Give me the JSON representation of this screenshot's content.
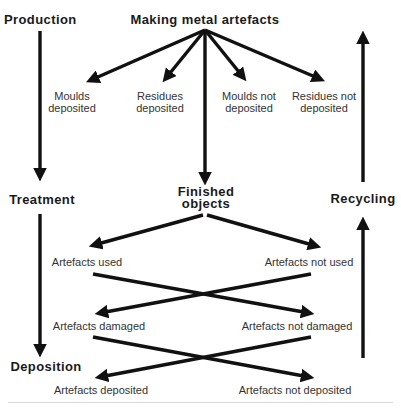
{
  "diagram": {
    "nodes": {
      "production": "Production",
      "making": "Making metal artefacts",
      "moulds_dep_1": "Moulds",
      "moulds_dep_2": "deposited",
      "residues_dep_1": "Residues",
      "residues_dep_2": "deposited",
      "moulds_not_1": "Moulds not",
      "moulds_not_2": "deposited",
      "residues_not_1": "Residues not",
      "residues_not_2": "deposited",
      "treatment": "Treatment",
      "finished_1": "Finished",
      "finished_2": "objects",
      "recycling": "Recycling",
      "used": "Artefacts used",
      "not_used": "Artefacts not used",
      "damaged": "Artefacts damaged",
      "not_damaged": "Artefacts not damaged",
      "deposition": "Deposition",
      "deposited": "Artefacts deposited",
      "not_deposited": "Artefacts not deposited"
    },
    "edges": [
      {
        "from": "Production",
        "to": "Treatment"
      },
      {
        "from": "Treatment",
        "to": "Deposition"
      },
      {
        "from": "Making metal artefacts",
        "to": "Moulds deposited"
      },
      {
        "from": "Making metal artefacts",
        "to": "Residues deposited"
      },
      {
        "from": "Making metal artefacts",
        "to": "Moulds not deposited"
      },
      {
        "from": "Making metal artefacts",
        "to": "Residues not deposited"
      },
      {
        "from": "Making metal artefacts",
        "to": "Finished objects"
      },
      {
        "from": "Finished objects",
        "to": "Artefacts used"
      },
      {
        "from": "Finished objects",
        "to": "Artefacts not used"
      },
      {
        "from": "Artefacts used",
        "to": "Artefacts not damaged"
      },
      {
        "from": "Artefacts not used",
        "to": "Artefacts damaged"
      },
      {
        "from": "Artefacts damaged",
        "to": "Artefacts not deposited"
      },
      {
        "from": "Artefacts not damaged",
        "to": "Artefacts deposited"
      },
      {
        "from": "(bottom)",
        "to": "Recycling"
      },
      {
        "from": "Recycling",
        "to": "(top)"
      }
    ]
  }
}
